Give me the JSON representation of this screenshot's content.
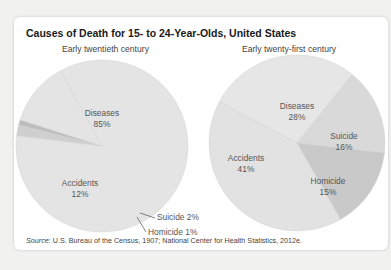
{
  "chart_data": [
    {
      "type": "pie",
      "title": "Causes of Death for 15- to 24-Year-Olds, United States",
      "subtitle": "Early twentieth century",
      "slices": [
        {
          "label": "Diseases",
          "value": 85,
          "display": "85%",
          "color": "#e4e4e4"
        },
        {
          "label": "Suicide",
          "value": 2,
          "display": "2%",
          "color": "#cfcfcf"
        },
        {
          "label": "Homicide",
          "value": 1,
          "display": "1%",
          "color": "#bdbdbd"
        },
        {
          "label": "Accidents",
          "value": 12,
          "display": "12%",
          "color": "#e4e4e4"
        }
      ]
    },
    {
      "type": "pie",
      "title": "Causes of Death for 15- to 24-Year-Olds, United States",
      "subtitle": "Early twenty-first century",
      "slices": [
        {
          "label": "Diseases",
          "value": 28,
          "display": "28%",
          "color": "#e6e6e6"
        },
        {
          "label": "Suicide",
          "value": 16,
          "display": "16%",
          "color": "#d9d9d9"
        },
        {
          "label": "Homicide",
          "value": 15,
          "display": "15%",
          "color": "#c9c9c9"
        },
        {
          "label": "Accidents",
          "value": 41,
          "display": "41%",
          "color": "#e2e2e2"
        }
      ]
    }
  ],
  "figure": {
    "title": "Causes of Death for 15- to 24-Year-Olds, United States",
    "left_subtitle": "Early twentieth century",
    "right_subtitle": "Early twenty-first century",
    "source_label": "Source",
    "source_text": ": U.S. Bureau of the Census, 1907; National Center for Health Statistics, 2012e."
  }
}
